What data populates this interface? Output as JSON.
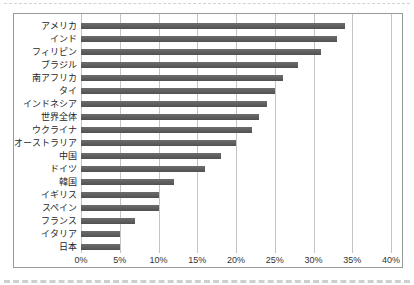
{
  "chart_data": {
    "type": "bar",
    "orientation": "horizontal",
    "title": "",
    "xlabel": "",
    "ylabel": "",
    "unit": "%",
    "categories": [
      "アメリカ",
      "インド",
      "フィリピン",
      "ブラジル",
      "南アフリカ",
      "タイ",
      "インドネシア",
      "世界全体",
      "ウクライナ",
      "オーストラリア",
      "中国",
      "ドイツ",
      "韓国",
      "イギリス",
      "スペイン",
      "フランス",
      "イタリア",
      "日本"
    ],
    "values": [
      34,
      33,
      31,
      28,
      26,
      25,
      24,
      23,
      22,
      20,
      18,
      16,
      12,
      10,
      10,
      7,
      5,
      5
    ],
    "xlim": [
      0,
      40
    ],
    "x_tick_step": 5,
    "x_tick_labels": [
      "0%",
      "5%",
      "10%",
      "15%",
      "20%",
      "25%",
      "30%",
      "35%",
      "40%"
    ],
    "grid": true,
    "legend": false,
    "colors": {
      "bar": "#595959",
      "gridline": "#c4c4c4",
      "box_border": "#999999",
      "label_text": "#1f1f1f",
      "tick_text": "#333333",
      "background": "#ffffff"
    }
  }
}
